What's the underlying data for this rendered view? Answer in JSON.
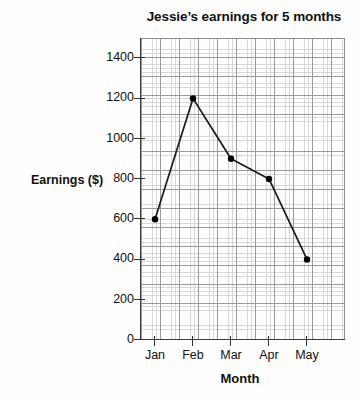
{
  "chart_data": {
    "type": "line",
    "title": "Jessie’s earnings for 5 months",
    "xlabel": "Month",
    "ylabel": "Earnings ($)",
    "categories": [
      "Jan",
      "Feb",
      "Mar",
      "Apr",
      "May"
    ],
    "values": [
      600,
      1200,
      900,
      800,
      400
    ],
    "series": [
      {
        "name": "Earnings",
        "values": [
          600,
          1200,
          900,
          800,
          400
        ]
      }
    ],
    "ylim": [
      0,
      1500
    ],
    "y_ticks": [
      0,
      200,
      400,
      600,
      800,
      1000,
      1200,
      1400
    ],
    "y_tick_labels": [
      "0",
      "200",
      "400",
      "600",
      "800",
      "1000",
      "1200",
      "1400"
    ],
    "x_tick_labels": [
      "Jan",
      "Feb",
      "Mar",
      "Apr",
      "May"
    ],
    "grid": true,
    "grid_style": "graph-paper",
    "legend": "none",
    "marker": "filled-circle",
    "line_color": "#1a1a1a",
    "marker_color": "#000000",
    "grid_minor_color": "#d8d8d8",
    "grid_major_color": "#9a9a9a",
    "axis_color": "#333333",
    "background": "#fdfdfd"
  }
}
